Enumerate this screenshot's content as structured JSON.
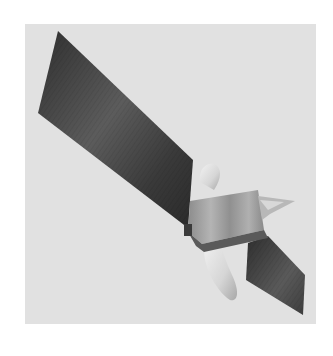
{
  "image": {
    "subject": "satellite with solar panels",
    "style": "grayscale",
    "colors": {
      "page_background": "#ffffff",
      "frame_background": "#e1e1e1",
      "panel_dark": "#3a3a3a",
      "panel_mid": "#5a5a5a",
      "panel_light": "#7a7a7a",
      "body": "#9a9a9a",
      "body_light": "#bdbdbd",
      "antenna": "#e8e8e8"
    }
  }
}
